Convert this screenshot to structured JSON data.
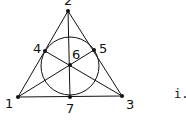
{
  "diagram": {
    "caption": "i.",
    "points": [
      {
        "id": "1",
        "label": "1",
        "x": 18,
        "y": 97,
        "lx": 5,
        "ly": 108
      },
      {
        "id": "2",
        "label": "2",
        "x": 68,
        "y": 11,
        "lx": 64,
        "ly": 5
      },
      {
        "id": "3",
        "label": "3",
        "x": 122,
        "y": 96,
        "lx": 126,
        "ly": 109
      },
      {
        "id": "4",
        "label": "4",
        "x": 45,
        "y": 51,
        "lx": 33,
        "ly": 53
      },
      {
        "id": "5",
        "label": "5",
        "x": 94,
        "y": 50,
        "lx": 99,
        "ly": 53
      },
      {
        "id": "6",
        "label": "6",
        "x": 70,
        "y": 65,
        "lx": 72,
        "ly": 59
      },
      {
        "id": "7",
        "label": "7",
        "x": 70,
        "y": 97,
        "lx": 66,
        "ly": 113
      }
    ],
    "lines": [
      [
        "1",
        "2"
      ],
      [
        "2",
        "3"
      ],
      [
        "1",
        "3"
      ],
      [
        "1",
        "5"
      ],
      [
        "3",
        "4"
      ],
      [
        "2",
        "7"
      ]
    ],
    "circle": {
      "cx": 70,
      "cy": 66,
      "r": 29
    },
    "colors": {
      "stroke": "#111111",
      "point": "#111111"
    }
  }
}
